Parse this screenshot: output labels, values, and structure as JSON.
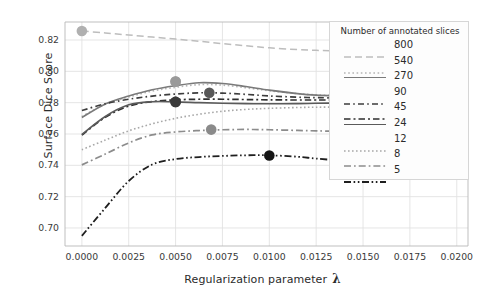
{
  "chart_data": {
    "type": "line",
    "title": "",
    "xlabel": "Regularization parameter λ",
    "ylabel": "Surface Dice Score",
    "xlim": [
      -0.0009,
      0.0206
    ],
    "ylim": [
      0.6885,
      0.8315
    ],
    "grid": true,
    "legend_title": "Number of annotated slices",
    "legend_position": "upper right",
    "xticks": [
      "0.0000",
      "0.0025",
      "0.0050",
      "0.0075",
      "0.0100",
      "0.0125",
      "0.0150",
      "0.0175",
      "0.0200"
    ],
    "xtick_values": [
      0.0,
      0.0025,
      0.005,
      0.0075,
      0.01,
      0.0125,
      0.015,
      0.0175,
      0.02
    ],
    "yticks": [
      "0.70",
      "0.72",
      "0.74",
      "0.76",
      "0.78",
      "0.80",
      "0.82"
    ],
    "ytick_values": [
      0.7,
      0.72,
      0.74,
      0.76,
      0.78,
      0.8,
      0.82
    ],
    "x": [
      0.0,
      0.00125,
      0.0025,
      0.00375,
      0.005,
      0.00625,
      0.0075,
      0.00875,
      0.01,
      0.0115,
      0.0125,
      0.0138,
      0.015,
      0.0175,
      0.02
    ],
    "series": [
      {
        "name": "800",
        "color": "#bdbdbd",
        "dash": "7,4",
        "width": 1.5,
        "values": [
          0.8258,
          0.8245,
          0.8232,
          0.8219,
          0.8206,
          0.8192,
          0.8177,
          0.8163,
          0.815,
          0.8139,
          0.8134,
          0.813,
          0.8128,
          0.8127,
          0.8128
        ],
        "marker": {
          "x": 0.0,
          "y": 0.8258,
          "color": "#b0b0b0"
        }
      },
      {
        "name": "540",
        "color": "#b5b5b5",
        "dash": "1.6,2.6",
        "width": 1.6,
        "values": [
          0.7712,
          0.779,
          0.7836,
          0.7874,
          0.7898,
          0.7915,
          0.7912,
          0.7895,
          0.7876,
          0.7858,
          0.785,
          0.7844,
          0.7841,
          0.784,
          0.784
        ],
        "marker": {
          "x": 0.005,
          "y": 0.7935,
          "color": "#9a9a9a"
        }
      },
      {
        "name": "270",
        "color": "#7a7a7a",
        "dash": "none",
        "width": 1.6,
        "values": [
          0.7705,
          0.7792,
          0.7842,
          0.7882,
          0.7908,
          0.7927,
          0.7922,
          0.7903,
          0.788,
          0.7858,
          0.7848,
          0.7842,
          0.7838,
          0.7836,
          0.7836
        ],
        "marker": {
          "x": 0.005,
          "y": 0.7935,
          "color": "#9a9a9a"
        }
      },
      {
        "name": "90",
        "color": "#3d3d3d",
        "dash": "6,3.2,1.6,3.2",
        "width": 1.7,
        "values": [
          0.775,
          0.7793,
          0.7822,
          0.7842,
          0.7855,
          0.7863,
          0.7861,
          0.7853,
          0.7843,
          0.7835,
          0.7832,
          0.783,
          0.7828,
          0.7828,
          0.7828
        ],
        "marker": {
          "x": 0.0068,
          "y": 0.7863,
          "color": "#585858"
        }
      },
      {
        "name": "45",
        "color": "#2e2e2e",
        "dash": "6.5,3,2,3",
        "width": 1.7,
        "values": [
          0.7593,
          0.7707,
          0.7778,
          0.7807,
          0.7818,
          0.7822,
          0.7822,
          0.782,
          0.7818,
          0.7817,
          0.7817,
          0.7817,
          0.7817,
          0.7818,
          0.7818
        ],
        "marker": {
          "x": 0.005,
          "y": 0.7805,
          "color": "#3a3a3a"
        }
      },
      {
        "name": "24",
        "color": "#5a5a5a",
        "dash": "none",
        "width": 1.6,
        "values": [
          0.7597,
          0.7712,
          0.7786,
          0.7806,
          0.7805,
          0.78,
          0.7796,
          0.7794,
          0.7793,
          0.7794,
          0.7796,
          0.7798,
          0.78,
          0.7802,
          0.7802
        ],
        "marker": {
          "x": 0.005,
          "y": 0.7805,
          "color": "#3a3a3a"
        }
      },
      {
        "name": "12",
        "color": "#a8a8a8",
        "dash": "1.6,2.4",
        "width": 1.6,
        "values": [
          0.75,
          0.7561,
          0.762,
          0.7665,
          0.77,
          0.7726,
          0.7745,
          0.7757,
          0.7764,
          0.7769,
          0.7771,
          0.7772,
          0.7772,
          0.7772,
          0.7772
        ],
        "marker": null
      },
      {
        "name": "8",
        "color": "#8c8c8c",
        "dash": "7,3,1.7,3",
        "width": 1.7,
        "values": [
          0.7403,
          0.7472,
          0.7543,
          0.7594,
          0.7613,
          0.7622,
          0.7627,
          0.7629,
          0.7627,
          0.7623,
          0.762,
          0.7617,
          0.7615,
          0.7613,
          0.7613
        ],
        "marker": {
          "x": 0.0069,
          "y": 0.7628,
          "color": "#8a8a8a"
        }
      },
      {
        "name": "5",
        "color": "#1f1f1f",
        "dash": "7,2.6,1.6,2.6,1.6,2.6",
        "width": 1.8,
        "values": [
          0.695,
          0.7128,
          0.73,
          0.7405,
          0.744,
          0.7453,
          0.746,
          0.7464,
          0.7464,
          0.7455,
          0.7443,
          0.7432,
          0.743,
          0.743,
          0.743
        ],
        "marker": {
          "x": 0.01,
          "y": 0.7463,
          "color": "#151515"
        }
      }
    ]
  },
  "legend": {
    "title": "Number of annotated slices",
    "entries": [
      "800",
      "540",
      "270",
      "90",
      "45",
      "24",
      "12",
      "8",
      "5"
    ]
  },
  "axes": {
    "ylabel": "Surface Dice Score",
    "xlabel_text": "Regularization parameter",
    "xlabel_symbol": "λ"
  }
}
